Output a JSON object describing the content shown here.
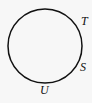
{
  "diagram": {
    "shape": "circle",
    "circle": {
      "cx": 45,
      "cy": 46,
      "r": 37,
      "stroke": "#111111"
    },
    "points": [
      {
        "label": "T",
        "x": 81,
        "y": 15
      },
      {
        "label": "S",
        "x": 80,
        "y": 61
      },
      {
        "label": "U",
        "x": 40,
        "y": 84
      }
    ]
  }
}
